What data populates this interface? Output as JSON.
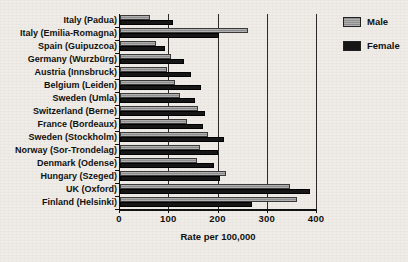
{
  "chart_data": {
    "type": "bar",
    "orientation": "horizontal",
    "title": "",
    "xlabel": "Rate per 100,000",
    "ylabel": "",
    "xlim": [
      0,
      400
    ],
    "xticks": [
      0,
      100,
      200,
      300,
      400
    ],
    "xtick_labels": [
      "0",
      "100",
      "200",
      "300",
      "400"
    ],
    "grid": true,
    "legend_position": "top-right",
    "categories": [
      "Italy (Padua)",
      "Italy (Emilia-Romagna)",
      "Spain (Guipuzcoa)",
      "Germany (Wurzbürg)",
      "Austria (Innsbruck)",
      "Belgium (Leiden)",
      "Sweden (Umla)",
      "Switzerland (Berne)",
      "France (Bordeaux)",
      "Sweden (Stockholm)",
      "Norway (Sor-Trondelag)",
      "Denmark (Odense)",
      "Hungary (Szeged)",
      "UK (Oxford)",
      "Finland (Helsinki)"
    ],
    "series": [
      {
        "name": "Male",
        "color": "#8f8f8f",
        "values": [
          60,
          260,
          74,
          104,
          96,
          112,
          122,
          158,
          136,
          178,
          162,
          156,
          216,
          345,
          360
        ]
      },
      {
        "name": "Female",
        "color": "#161616",
        "values": [
          108,
          200,
          92,
          130,
          144,
          164,
          152,
          172,
          168,
          212,
          198,
          190,
          204,
          385,
          268
        ]
      }
    ]
  },
  "legend": {
    "items": [
      {
        "label": "Male"
      },
      {
        "label": "Female"
      }
    ]
  },
  "colors": {
    "male": "#8f8f8f",
    "female": "#161616",
    "background": "#efece7",
    "axis": "#111111"
  }
}
